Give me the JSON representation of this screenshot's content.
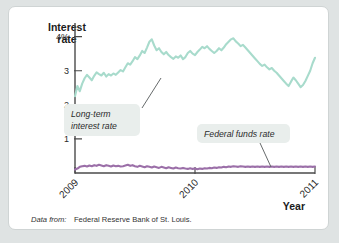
{
  "figure": {
    "source_note_italic": "Data from:",
    "source_note_plain": "Federal Reserve Bank of St. Louis."
  },
  "chart_data": {
    "type": "line",
    "title": "",
    "ylabel_line1": "Interest",
    "ylabel_line2": "rate",
    "xlabel": "Year",
    "grid": false,
    "legend_position": "inline-annotations",
    "ylim": [
      0,
      4.4
    ],
    "xlim": [
      2009.0,
      2011.0
    ],
    "ytick_labels": [
      "4%",
      "3",
      "2",
      "1"
    ],
    "ytick_values": [
      4,
      3,
      2,
      1
    ],
    "xtick_labels": [
      "2009",
      "2010",
      "2011"
    ],
    "xtick_values": [
      2009,
      2010,
      2011
    ],
    "annotations": [
      {
        "name": "long-term-interest-rate",
        "line1": "Long-term",
        "line2": "interest rate",
        "color": "#a8dbcc"
      },
      {
        "name": "federal-funds-rate",
        "line1": "Federal funds rate",
        "line2": "",
        "color": "#9b6fa8"
      }
    ],
    "series": [
      {
        "name": "Long-term interest rate",
        "color": "#a8dbcc",
        "x": [
          2009.0,
          2009.02,
          2009.04,
          2009.06,
          2009.08,
          2009.1,
          2009.12,
          2009.14,
          2009.16,
          2009.18,
          2009.2,
          2009.22,
          2009.24,
          2009.26,
          2009.28,
          2009.3,
          2009.32,
          2009.34,
          2009.36,
          2009.38,
          2009.4,
          2009.42,
          2009.44,
          2009.46,
          2009.48,
          2009.5,
          2009.52,
          2009.54,
          2009.56,
          2009.58,
          2009.6,
          2009.62,
          2009.64,
          2009.66,
          2009.68,
          2009.7,
          2009.72,
          2009.74,
          2009.76,
          2009.78,
          2009.8,
          2009.82,
          2009.84,
          2009.86,
          2009.88,
          2009.9,
          2009.92,
          2009.94,
          2009.96,
          2009.98,
          2010.0,
          2010.02,
          2010.04,
          2010.06,
          2010.08,
          2010.1,
          2010.12,
          2010.14,
          2010.16,
          2010.18,
          2010.2,
          2010.22,
          2010.24,
          2010.26,
          2010.28,
          2010.3,
          2010.32,
          2010.34,
          2010.36,
          2010.38,
          2010.4,
          2010.42,
          2010.44,
          2010.46,
          2010.48,
          2010.5,
          2010.52,
          2010.54,
          2010.56,
          2010.58,
          2010.6,
          2010.62,
          2010.64,
          2010.66,
          2010.68,
          2010.7,
          2010.72,
          2010.74,
          2010.76,
          2010.78,
          2010.8,
          2010.82,
          2010.84,
          2010.86,
          2010.88,
          2010.9,
          2010.92,
          2010.94,
          2010.96,
          2010.98,
          2011.0
        ],
        "values": [
          2.25,
          2.55,
          2.4,
          2.62,
          2.78,
          2.88,
          2.8,
          2.72,
          2.85,
          2.95,
          2.9,
          2.86,
          2.94,
          2.83,
          2.9,
          2.86,
          2.92,
          2.88,
          2.95,
          3.02,
          2.98,
          3.1,
          3.22,
          3.18,
          3.28,
          3.4,
          3.34,
          3.45,
          3.58,
          3.52,
          3.68,
          3.85,
          3.92,
          3.74,
          3.6,
          3.66,
          3.55,
          3.48,
          3.55,
          3.46,
          3.4,
          3.35,
          3.42,
          3.38,
          3.45,
          3.34,
          3.4,
          3.52,
          3.58,
          3.5,
          3.46,
          3.55,
          3.62,
          3.7,
          3.66,
          3.72,
          3.64,
          3.58,
          3.52,
          3.58,
          3.66,
          3.6,
          3.68,
          3.78,
          3.85,
          3.92,
          3.95,
          3.86,
          3.8,
          3.72,
          3.76,
          3.68,
          3.6,
          3.52,
          3.44,
          3.36,
          3.28,
          3.2,
          3.14,
          3.18,
          3.1,
          3.04,
          3.08,
          3.0,
          2.94,
          2.86,
          2.78,
          2.7,
          2.62,
          2.55,
          2.68,
          2.8,
          2.72,
          2.62,
          2.52,
          2.58,
          2.7,
          2.85,
          3.0,
          3.22,
          3.38
        ]
      },
      {
        "name": "Federal funds rate",
        "color": "#9b6fa8",
        "x": [
          2009.0,
          2009.02,
          2009.04,
          2009.06,
          2009.08,
          2009.1,
          2009.12,
          2009.14,
          2009.16,
          2009.18,
          2009.2,
          2009.22,
          2009.24,
          2009.26,
          2009.28,
          2009.3,
          2009.32,
          2009.34,
          2009.36,
          2009.38,
          2009.4,
          2009.42,
          2009.44,
          2009.46,
          2009.48,
          2009.5,
          2009.52,
          2009.54,
          2009.56,
          2009.58,
          2009.6,
          2009.62,
          2009.64,
          2009.66,
          2009.68,
          2009.7,
          2009.72,
          2009.74,
          2009.76,
          2009.78,
          2009.8,
          2009.82,
          2009.84,
          2009.86,
          2009.88,
          2009.9,
          2009.92,
          2009.94,
          2009.96,
          2009.98,
          2010.0,
          2010.02,
          2010.04,
          2010.06,
          2010.08,
          2010.1,
          2010.12,
          2010.14,
          2010.16,
          2010.18,
          2010.2,
          2010.22,
          2010.24,
          2010.26,
          2010.28,
          2010.3,
          2010.32,
          2010.34,
          2010.36,
          2010.38,
          2010.4,
          2010.42,
          2010.44,
          2010.46,
          2010.48,
          2010.5,
          2010.52,
          2010.54,
          2010.56,
          2010.58,
          2010.6,
          2010.62,
          2010.64,
          2010.66,
          2010.68,
          2010.7,
          2010.72,
          2010.74,
          2010.76,
          2010.78,
          2010.8,
          2010.82,
          2010.84,
          2010.86,
          2010.88,
          2010.9,
          2010.92,
          2010.94,
          2010.96,
          2010.98,
          2011.0
        ],
        "values": [
          0.1,
          0.13,
          0.18,
          0.2,
          0.21,
          0.19,
          0.22,
          0.2,
          0.23,
          0.21,
          0.24,
          0.22,
          0.2,
          0.23,
          0.21,
          0.19,
          0.22,
          0.2,
          0.21,
          0.19,
          0.2,
          0.22,
          0.24,
          0.21,
          0.23,
          0.2,
          0.18,
          0.21,
          0.19,
          0.17,
          0.2,
          0.18,
          0.16,
          0.19,
          0.17,
          0.15,
          0.18,
          0.16,
          0.14,
          0.17,
          0.15,
          0.13,
          0.16,
          0.14,
          0.13,
          0.15,
          0.13,
          0.12,
          0.14,
          0.12,
          0.13,
          0.11,
          0.13,
          0.12,
          0.14,
          0.13,
          0.15,
          0.14,
          0.16,
          0.15,
          0.17,
          0.16,
          0.18,
          0.17,
          0.19,
          0.18,
          0.2,
          0.19,
          0.18,
          0.2,
          0.19,
          0.18,
          0.19,
          0.18,
          0.19,
          0.18,
          0.19,
          0.18,
          0.19,
          0.18,
          0.19,
          0.18,
          0.19,
          0.18,
          0.19,
          0.18,
          0.19,
          0.18,
          0.19,
          0.18,
          0.19,
          0.18,
          0.19,
          0.18,
          0.19,
          0.18,
          0.19,
          0.18,
          0.19,
          0.18,
          0.19
        ]
      }
    ]
  }
}
